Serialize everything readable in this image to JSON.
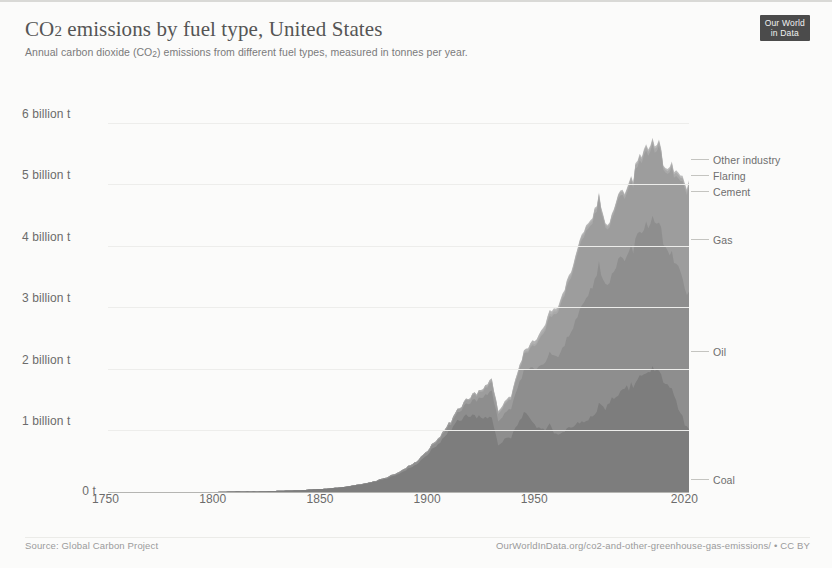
{
  "header": {
    "title_main": "CO",
    "title_sub": "2",
    "title_rest": " emissions by fuel type, United States",
    "subtitle_a": "Annual carbon dioxide (CO",
    "subtitle_sub": "2",
    "subtitle_b": ") emissions from different fuel types, measured in tonnes per year."
  },
  "logo": {
    "line1": "Our World",
    "line2": "in Data"
  },
  "footer": {
    "source": "Source: Global Carbon Project",
    "url": "OurWorldInData.org/co2-and-other-greenhouse-gas-emissions/ • CC BY"
  },
  "chart_data": {
    "type": "area",
    "stacked": true,
    "title": "CO2 emissions by fuel type, United States",
    "subtitle": "Annual carbon dioxide (CO2) emissions from different fuel types, measured in tonnes per year.",
    "xlabel": "",
    "ylabel": "",
    "unit": "tonnes per year",
    "grid": true,
    "legend_position": "right-inline",
    "xlim": [
      1750,
      2021
    ],
    "ylim": [
      0,
      6500000000
    ],
    "ytick_labels": [
      "0 t",
      "1 billion t",
      "2 billion t",
      "3 billion t",
      "4 billion t",
      "5 billion t",
      "6 billion t"
    ],
    "ytick_values": [
      0,
      1000000000,
      2000000000,
      3000000000,
      4000000000,
      5000000000,
      6000000000
    ],
    "xtick_labels": [
      "1750",
      "1800",
      "1850",
      "1900",
      "1950",
      "2020"
    ],
    "xtick_values": [
      1750,
      1800,
      1850,
      1900,
      1950,
      2020
    ],
    "colors": {
      "Coal": "#7d7d7d",
      "Oil": "#8e8e8e",
      "Gas": "#9d9d9d",
      "Cement": "#a9a9a9",
      "Flaring": "#b2b2b2",
      "Other industry": "#bcbcbc"
    },
    "x": [
      1750,
      1760,
      1770,
      1780,
      1790,
      1800,
      1810,
      1820,
      1830,
      1840,
      1850,
      1860,
      1870,
      1875,
      1880,
      1885,
      1890,
      1895,
      1900,
      1905,
      1910,
      1913,
      1916,
      1918,
      1920,
      1923,
      1926,
      1929,
      1932,
      1935,
      1938,
      1941,
      1944,
      1946,
      1948,
      1950,
      1953,
      1956,
      1959,
      1962,
      1965,
      1968,
      1971,
      1974,
      1977,
      1979,
      1982,
      1985,
      1988,
      1991,
      1994,
      1997,
      2000,
      2003,
      2005,
      2007,
      2009,
      2011,
      2013,
      2015,
      2017,
      2019,
      2021
    ],
    "series": [
      {
        "name": "Coal",
        "label_y_frac": 0.955,
        "values_billion_t": [
          0.0,
          0.0,
          0.0,
          0.0,
          0.0,
          0.0,
          0.01,
          0.01,
          0.02,
          0.03,
          0.05,
          0.08,
          0.13,
          0.17,
          0.22,
          0.28,
          0.38,
          0.47,
          0.65,
          0.82,
          1.02,
          1.15,
          1.2,
          1.25,
          1.22,
          1.22,
          1.18,
          1.22,
          0.78,
          0.86,
          0.88,
          1.12,
          1.28,
          1.2,
          1.14,
          1.05,
          1.0,
          1.08,
          0.94,
          0.95,
          1.05,
          1.1,
          1.12,
          1.2,
          1.3,
          1.4,
          1.38,
          1.5,
          1.62,
          1.65,
          1.72,
          1.82,
          1.92,
          1.96,
          2.0,
          2.02,
          1.78,
          1.77,
          1.7,
          1.45,
          1.32,
          1.07,
          1.0
        ]
      },
      {
        "name": "Oil",
        "label_y_frac": 0.635,
        "values_billion_t": [
          0.0,
          0.0,
          0.0,
          0.0,
          0.0,
          0.0,
          0.0,
          0.0,
          0.0,
          0.0,
          0.0,
          0.0,
          0.01,
          0.01,
          0.02,
          0.02,
          0.03,
          0.04,
          0.05,
          0.07,
          0.1,
          0.13,
          0.17,
          0.2,
          0.24,
          0.3,
          0.36,
          0.44,
          0.38,
          0.42,
          0.48,
          0.58,
          0.7,
          0.76,
          0.86,
          0.94,
          1.06,
          1.18,
          1.26,
          1.36,
          1.48,
          1.68,
          1.86,
          2.02,
          2.22,
          2.26,
          2.0,
          2.02,
          2.18,
          2.12,
          2.22,
          2.32,
          2.42,
          2.42,
          2.46,
          2.44,
          2.26,
          2.22,
          2.2,
          2.24,
          2.26,
          2.24,
          2.18
        ]
      },
      {
        "name": "Gas",
        "label_y_frac": 0.355,
        "values_billion_t": [
          0.0,
          0.0,
          0.0,
          0.0,
          0.0,
          0.0,
          0.0,
          0.0,
          0.0,
          0.0,
          0.0,
          0.0,
          0.0,
          0.0,
          0.0,
          0.01,
          0.01,
          0.01,
          0.02,
          0.02,
          0.03,
          0.04,
          0.05,
          0.06,
          0.07,
          0.09,
          0.11,
          0.14,
          0.12,
          0.14,
          0.16,
          0.2,
          0.25,
          0.29,
          0.35,
          0.4,
          0.5,
          0.6,
          0.7,
          0.8,
          0.88,
          0.98,
          1.08,
          1.06,
          1.04,
          1.06,
          0.94,
          0.9,
          1.0,
          1.02,
          1.08,
          1.12,
          1.18,
          1.14,
          1.14,
          1.22,
          1.22,
          1.28,
          1.36,
          1.44,
          1.48,
          1.62,
          1.66
        ]
      },
      {
        "name": "Cement",
        "label_y_frac": 0.235,
        "values_billion_t": [
          0.0,
          0.0,
          0.0,
          0.0,
          0.0,
          0.0,
          0.0,
          0.0,
          0.0,
          0.0,
          0.0,
          0.0,
          0.0,
          0.0,
          0.0,
          0.0,
          0.0,
          0.0,
          0.0,
          0.01,
          0.01,
          0.01,
          0.01,
          0.01,
          0.02,
          0.02,
          0.02,
          0.03,
          0.02,
          0.02,
          0.02,
          0.02,
          0.02,
          0.03,
          0.03,
          0.03,
          0.04,
          0.04,
          0.04,
          0.04,
          0.05,
          0.05,
          0.05,
          0.05,
          0.05,
          0.05,
          0.04,
          0.05,
          0.05,
          0.05,
          0.05,
          0.06,
          0.06,
          0.06,
          0.06,
          0.06,
          0.04,
          0.04,
          0.05,
          0.05,
          0.05,
          0.05,
          0.05
        ]
      },
      {
        "name": "Flaring",
        "label_y_frac": 0.195,
        "values_billion_t": [
          0.0,
          0.0,
          0.0,
          0.0,
          0.0,
          0.0,
          0.0,
          0.0,
          0.0,
          0.0,
          0.0,
          0.0,
          0.0,
          0.0,
          0.0,
          0.0,
          0.0,
          0.0,
          0.0,
          0.0,
          0.0,
          0.0,
          0.01,
          0.01,
          0.01,
          0.01,
          0.02,
          0.02,
          0.02,
          0.02,
          0.02,
          0.03,
          0.03,
          0.03,
          0.04,
          0.04,
          0.04,
          0.04,
          0.03,
          0.03,
          0.03,
          0.02,
          0.02,
          0.02,
          0.02,
          0.02,
          0.01,
          0.01,
          0.01,
          0.01,
          0.01,
          0.01,
          0.01,
          0.01,
          0.01,
          0.01,
          0.01,
          0.01,
          0.01,
          0.01,
          0.01,
          0.01,
          0.01
        ]
      },
      {
        "name": "Other industry",
        "label_y_frac": 0.155,
        "values_billion_t": [
          0.0,
          0.0,
          0.0,
          0.0,
          0.0,
          0.0,
          0.0,
          0.0,
          0.0,
          0.0,
          0.0,
          0.0,
          0.0,
          0.0,
          0.0,
          0.0,
          0.0,
          0.0,
          0.0,
          0.0,
          0.0,
          0.0,
          0.0,
          0.0,
          0.0,
          0.0,
          0.0,
          0.01,
          0.01,
          0.01,
          0.01,
          0.01,
          0.01,
          0.01,
          0.01,
          0.01,
          0.02,
          0.02,
          0.02,
          0.02,
          0.02,
          0.02,
          0.02,
          0.02,
          0.02,
          0.02,
          0.02,
          0.02,
          0.02,
          0.02,
          0.02,
          0.03,
          0.03,
          0.03,
          0.03,
          0.03,
          0.02,
          0.03,
          0.03,
          0.03,
          0.03,
          0.03,
          0.03
        ]
      }
    ],
    "peak": {
      "year": 2007,
      "total_billion_t": 5.78
    }
  }
}
